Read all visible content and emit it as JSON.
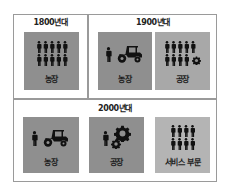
{
  "eras": [
    {
      "label": "1800년대",
      "tiles": [
        {
          "label": "농장",
          "icons": "10 people",
          "color": "#8f8f8f"
        }
      ]
    },
    {
      "label": "1900년대",
      "tiles": [
        {
          "label": "농장",
          "icons": "1 person + tractor",
          "color": "#8f8f8f"
        },
        {
          "label": "공장",
          "icons": "9 people + gear",
          "color": "#a8a8a8"
        }
      ]
    },
    {
      "label": "2000년대",
      "tiles": [
        {
          "label": "농장",
          "icons": "1 person + tractor",
          "color": "#8f8f8f"
        },
        {
          "label": "공장",
          "icons": "1 person + large gear",
          "color": "#8f8f8f"
        },
        {
          "label": "서비스 부문",
          "icons": "8 people",
          "color": "#b4b4b4"
        }
      ]
    }
  ],
  "colors": {
    "frame": "#9a9a9a",
    "dark_tile": "#8f8f8f",
    "mid_tile": "#a8a8a8",
    "light_tile": "#b4b4b4",
    "icon": "#111111"
  }
}
